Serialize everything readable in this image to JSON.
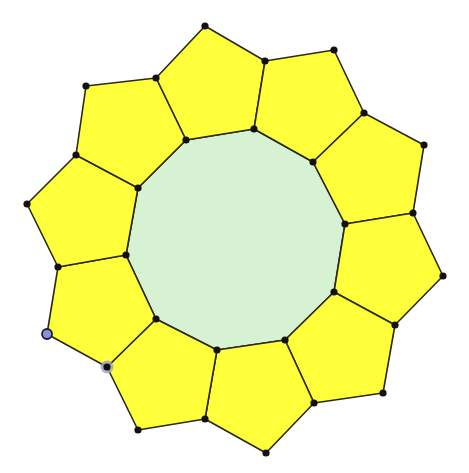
{
  "diagram": {
    "title": "",
    "colors": {
      "background": "#ffffff",
      "pentagon_fill": "#fefe3a",
      "decagon_fill": "#d6f2d2",
      "stroke": "#2a2a14",
      "vertex": "#151010",
      "selected_vertex_fill": "#8a92d4",
      "selected_vertex_stroke": "#1c1c3a",
      "highlight_vertex_halo": "#9aa0c4"
    },
    "decagon": {
      "points": [
        [
          186,
          140
        ],
        [
          254,
          129
        ],
        [
          313,
          162
        ],
        [
          345,
          224
        ],
        [
          334,
          292
        ],
        [
          285,
          340
        ],
        [
          217,
          350
        ],
        [
          156,
          319
        ],
        [
          126,
          255
        ],
        [
          138,
          188
        ]
      ]
    },
    "pentagons": [
      {
        "points": [
          [
            186,
            140
          ],
          [
            156,
            78
          ],
          [
            205,
            26
          ],
          [
            265,
            61
          ],
          [
            254,
            129
          ]
        ]
      },
      {
        "points": [
          [
            254,
            129
          ],
          [
            265,
            61
          ],
          [
            334,
            50
          ],
          [
            364,
            113
          ],
          [
            313,
            162
          ]
        ]
      },
      {
        "points": [
          [
            313,
            162
          ],
          [
            364,
            113
          ],
          [
            424,
            145
          ],
          [
            413,
            213
          ],
          [
            345,
            224
          ]
        ]
      },
      {
        "points": [
          [
            345,
            224
          ],
          [
            413,
            213
          ],
          [
            443,
            276
          ],
          [
            395,
            325
          ],
          [
            334,
            292
          ]
        ]
      },
      {
        "points": [
          [
            334,
            292
          ],
          [
            395,
            325
          ],
          [
            383,
            393
          ],
          [
            314,
            403
          ],
          [
            285,
            340
          ]
        ]
      },
      {
        "points": [
          [
            285,
            340
          ],
          [
            314,
            403
          ],
          [
            266,
            453
          ],
          [
            205,
            419
          ],
          [
            217,
            350
          ]
        ]
      },
      {
        "points": [
          [
            217,
            350
          ],
          [
            205,
            419
          ],
          [
            138,
            430
          ],
          [
            107,
            367
          ],
          [
            156,
            319
          ]
        ]
      },
      {
        "points": [
          [
            156,
            319
          ],
          [
            107,
            367
          ],
          [
            47,
            334
          ],
          [
            58,
            267
          ],
          [
            126,
            255
          ]
        ]
      },
      {
        "points": [
          [
            126,
            255
          ],
          [
            58,
            267
          ],
          [
            27,
            204
          ],
          [
            76,
            155
          ],
          [
            138,
            188
          ]
        ]
      },
      {
        "points": [
          [
            138,
            188
          ],
          [
            76,
            155
          ],
          [
            86,
            86
          ],
          [
            156,
            78
          ],
          [
            186,
            140
          ]
        ]
      }
    ],
    "vertices": [
      [
        186,
        140
      ],
      [
        254,
        129
      ],
      [
        313,
        162
      ],
      [
        345,
        224
      ],
      [
        334,
        292
      ],
      [
        285,
        340
      ],
      [
        217,
        350
      ],
      [
        156,
        319
      ],
      [
        126,
        255
      ],
      [
        138,
        188
      ],
      [
        156,
        78
      ],
      [
        205,
        26
      ],
      [
        265,
        61
      ],
      [
        334,
        50
      ],
      [
        364,
        113
      ],
      [
        424,
        145
      ],
      [
        413,
        213
      ],
      [
        443,
        276
      ],
      [
        395,
        325
      ],
      [
        383,
        393
      ],
      [
        314,
        403
      ],
      [
        266,
        453
      ],
      [
        205,
        419
      ],
      [
        138,
        430
      ],
      [
        107,
        367
      ],
      [
        58,
        267
      ],
      [
        27,
        204
      ],
      [
        76,
        155
      ],
      [
        86,
        86
      ]
    ],
    "selected_vertex": [
      47,
      334
    ],
    "highlighted_vertex": [
      107,
      367
    ]
  }
}
